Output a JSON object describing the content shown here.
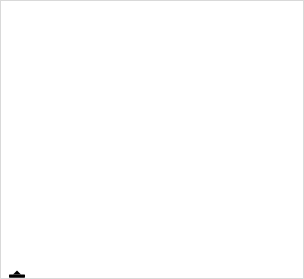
{
  "header": {
    "subtitle": "En dollars de 2012 par baril"
  },
  "colors": {
    "line": "#a44a96",
    "grid": "#dcdcdc",
    "axis": "#8a8a8a",
    "text": "#1a1a1a",
    "logo": "#e8621e",
    "background": "#ffffff"
  },
  "annotations": [
    {
      "id": "reconstruction",
      "label_line1": "Reconstruction",
      "label_line2": "d’après-guerre",
      "year": 1950,
      "value": 18
    },
    {
      "id": "embargo-iran",
      "label_line1": "Embargo sur",
      "label_line2": "le pétrole iranien",
      "year": 1953,
      "value": 17
    },
    {
      "id": "crise-suez",
      "label_line1": "Crise de Suez",
      "label_line2": "",
      "year": 1956,
      "value": 15
    },
    {
      "id": "guerre-kippour",
      "label_line1": "Guerre du",
      "label_line2": "Kippour",
      "year": 1973,
      "value": 14
    },
    {
      "id": "revolution-iranienne",
      "label_line1": "Révolution",
      "label_line2": "iranienne",
      "year": 1979,
      "value": 100
    },
    {
      "id": "invasion-koweit",
      "label_line1": "Invasion",
      "label_line2": "irakienne",
      "label_line3": "du Koweït",
      "year": 1990,
      "value": 36
    },
    {
      "id": "crise-asiatique",
      "label_line1": "Crise",
      "label_line2": "financière",
      "label_line3": "asiatique",
      "year": 1998,
      "value": 20
    },
    {
      "id": "guerre-irak",
      "label_line1": "Guerre d’Irak",
      "label_line2": "",
      "year": 2003,
      "value": 37
    },
    {
      "id": "printemps-arabes",
      "label_line1": "Printemps arabes",
      "label_line2": "",
      "year": 2011,
      "value": 109
    }
  ],
  "chart_data": {
    "type": "line",
    "subtitle": "En dollars de 2012 par baril",
    "xlabel": "",
    "ylabel": "",
    "xlim": [
      1947,
      2012
    ],
    "ylim": [
      0,
      115
    ],
    "yticks": [
      0,
      20,
      40,
      60,
      80,
      100
    ],
    "ytick_labels": [
      "0",
      "20",
      "40",
      "60",
      "80",
      "100"
    ],
    "xticks": [
      1950,
      1960,
      1970,
      1980,
      1990,
      2000,
      2012
    ],
    "xtick_labels": [
      "1950",
      "1960",
      "1970",
      "1980",
      "1990",
      "2000",
      "2012"
    ],
    "grid": true,
    "legend": null,
    "series": [
      {
        "name": "Prix du pétrole brut (USD 2012 / baril)",
        "color": "#a44a96",
        "x": [
          1947,
          1948,
          1949,
          1950,
          1951,
          1952,
          1953,
          1954,
          1955,
          1956,
          1957,
          1958,
          1959,
          1960,
          1961,
          1962,
          1963,
          1964,
          1965,
          1966,
          1967,
          1968,
          1969,
          1970,
          1971,
          1972,
          1973,
          1974,
          1975,
          1976,
          1977,
          1978,
          1979,
          1980,
          1981,
          1982,
          1983,
          1984,
          1985,
          1986,
          1987,
          1988,
          1989,
          1990,
          1991,
          1992,
          1993,
          1994,
          1995,
          1996,
          1997,
          1998,
          1999,
          2000,
          2001,
          2002,
          2003,
          2004,
          2005,
          2006,
          2007,
          2008,
          2009,
          2010,
          2011,
          2012
        ],
        "y": [
          16,
          18,
          16,
          15,
          15,
          15,
          15,
          15,
          15,
          15,
          17,
          16,
          16,
          16,
          16,
          15,
          15,
          15,
          15,
          14,
          14,
          14,
          14,
          13,
          14,
          14,
          16,
          46,
          52,
          53,
          52,
          50,
          72,
          105,
          95,
          84,
          70,
          67,
          62,
          30,
          37,
          29,
          35,
          40,
          33,
          32,
          29,
          27,
          29,
          34,
          31,
          20,
          26,
          41,
          35,
          33,
          36,
          45,
          60,
          70,
          75,
          100,
          62,
          79,
          108,
          110
        ]
      }
    ]
  }
}
